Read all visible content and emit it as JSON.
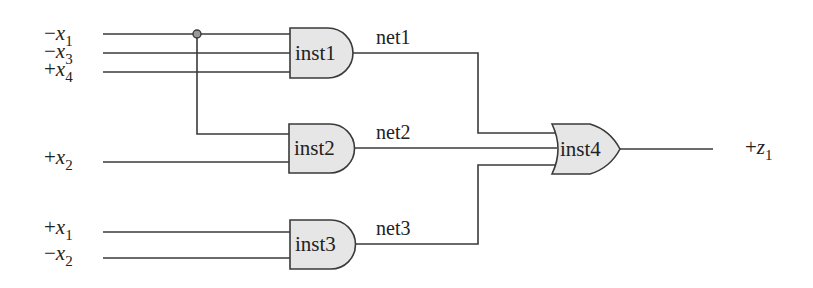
{
  "diagram": {
    "inputs": [
      {
        "sign": "−",
        "var": "x",
        "sub": "1"
      },
      {
        "sign": "−",
        "var": "x",
        "sub": "3"
      },
      {
        "sign": "+",
        "var": "x",
        "sub": "4"
      },
      {
        "sign": "+",
        "var": "x",
        "sub": "2"
      },
      {
        "sign": "+",
        "var": "x",
        "sub": "1"
      },
      {
        "sign": "−",
        "var": "x",
        "sub": "2"
      }
    ],
    "output": {
      "sign": "+",
      "var": "z",
      "sub": "1"
    },
    "gates": [
      {
        "name": "inst1",
        "type": "AND"
      },
      {
        "name": "inst2",
        "type": "AND"
      },
      {
        "name": "inst3",
        "type": "AND"
      },
      {
        "name": "inst4",
        "type": "OR"
      }
    ],
    "nets": [
      "net1",
      "net2",
      "net3"
    ],
    "colors": {
      "gate_fill": "#e6e6e6",
      "stroke": "#3a3a3a",
      "junction": "#9a9a9a"
    }
  }
}
